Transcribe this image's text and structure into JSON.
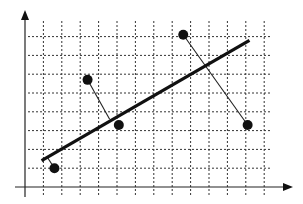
{
  "chart_data": {
    "type": "scatter",
    "title": "",
    "xlabel": "",
    "ylabel": "",
    "grid": true,
    "legend": null,
    "grid_units": {
      "x_cells": 13,
      "y_cells": 8
    },
    "points": [
      {
        "x": 1.6,
        "y": 1.0
      },
      {
        "x": 3.4,
        "y": 5.7
      },
      {
        "x": 5.1,
        "y": 3.3
      },
      {
        "x": 8.6,
        "y": 8.1
      },
      {
        "x": 12.1,
        "y": 3.3
      }
    ],
    "fit_line": {
      "x1": 0.9,
      "y1": 1.4,
      "x2": 12.2,
      "y2": 7.8
    },
    "residuals": [
      {
        "from": [
          1.6,
          1.0
        ],
        "to": [
          1.2,
          1.6
        ]
      },
      {
        "from": [
          3.4,
          5.7
        ],
        "to": [
          4.6,
          3.6
        ]
      },
      {
        "from": [
          8.6,
          8.1
        ],
        "to": [
          12.1,
          3.3
        ]
      }
    ],
    "xlim": [
      0,
      14
    ],
    "ylim": [
      0,
      9
    ]
  },
  "colors": {
    "background": "#ffffff",
    "ink": "#111111",
    "grid": "#333333"
  }
}
